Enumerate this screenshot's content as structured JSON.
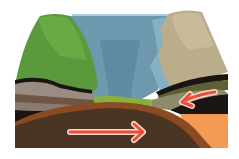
{
  "diagram": {
    "type": "geological-block-cross-section",
    "colors": {
      "sky": "#a9cfe6",
      "water": "#6e98ad",
      "water_light": "#86b0c4",
      "left_cliff_green": "#5a9a3c",
      "left_cliff_green_light": "#6aaa45",
      "right_cliff_tan": "#b9ad8c",
      "right_cliff_tan_light": "#c7bb9a",
      "grass_floor": "#8ab03c",
      "strata_gray": "#9a8c82",
      "strata_brown": "#6f5544",
      "strata_dark": "#1a1512",
      "strata_olive": "#5e5f35",
      "strata_khaki": "#8c8a6a",
      "mantle_dark": "#4a3424",
      "mantle_rim": "#8a4a22",
      "mantle_orange": "#f39a55",
      "arrow": "#e8503a",
      "arrow_outline": "#f7d7c9"
    },
    "arrows": [
      {
        "name": "right-plate-motion-arrow",
        "direction": "left-down"
      },
      {
        "name": "mantle-flow-arrow",
        "direction": "right"
      }
    ]
  }
}
